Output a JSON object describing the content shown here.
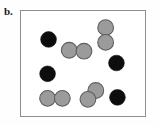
{
  "figure": {
    "panel_label": "b.",
    "colors": {
      "background": "#fefefe",
      "box_fill": "#ffffff",
      "box_border": "#8e8e8e",
      "particle_black_fill": "#0d0d0d",
      "particle_gray_fill": "#9b9b9b",
      "particle_gray_stroke": "#5d5d5d",
      "label_color": "#1a1a1a"
    },
    "box": {
      "x": 20,
      "y": 10,
      "width": 126,
      "height": 107
    }
  },
  "chart_data": {
    "type": "scatter",
    "title": "b.",
    "xlabel": "",
    "ylabel": "",
    "xlim": [
      0,
      126
    ],
    "ylim": [
      0,
      107
    ],
    "grid": false,
    "legend": "none",
    "series": [
      {
        "name": "black-particle",
        "marker": "filled-circle",
        "color": "#0d0d0d",
        "radius": 8,
        "points": [
          {
            "x": 28,
            "y": 29
          },
          {
            "x": 97,
            "y": 53
          },
          {
            "x": 27,
            "y": 64
          },
          {
            "x": 98,
            "y": 88
          }
        ]
      },
      {
        "name": "gray-particle",
        "marker": "outlined-circle",
        "color": "#9b9b9b",
        "radius": 8,
        "points": [
          {
            "x": 86,
            "y": 17
          },
          {
            "x": 86,
            "y": 32
          },
          {
            "x": 49,
            "y": 40
          },
          {
            "x": 64,
            "y": 41
          },
          {
            "x": 76,
            "y": 81
          },
          {
            "x": 68,
            "y": 90
          },
          {
            "x": 27,
            "y": 89
          },
          {
            "x": 42,
            "y": 89
          }
        ]
      }
    ],
    "pairs": [
      {
        "type": "gray-dimer",
        "orientation": "vertical",
        "members": [
          0,
          1
        ]
      },
      {
        "type": "gray-dimer",
        "orientation": "horizontal",
        "members": [
          2,
          3
        ]
      },
      {
        "type": "gray-dimer",
        "orientation": "diagonal",
        "members": [
          4,
          5
        ]
      },
      {
        "type": "gray-dimer",
        "orientation": "horizontal",
        "members": [
          6,
          7
        ]
      }
    ],
    "counts": {
      "black": 4,
      "gray": 8,
      "total": 12
    }
  }
}
